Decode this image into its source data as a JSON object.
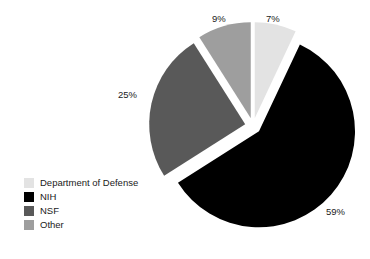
{
  "chart_data": {
    "type": "pie",
    "title": "",
    "subtitle": "",
    "xlabel": "",
    "ylabel": "",
    "grid": false,
    "legend_position": "bottom-left",
    "exploded": true,
    "start_angle_deg": 0,
    "direction": "clockwise",
    "categories": [
      "Department of Defense",
      "NIH",
      "NSF",
      "Other"
    ],
    "values": [
      7,
      59,
      25,
      9
    ],
    "value_unit": "%",
    "colors": [
      "#e3e3e3",
      "#000000",
      "#595959",
      "#9e9e9e"
    ],
    "slices": [
      {
        "label": "Department of Defense",
        "value": 7,
        "display": "7%",
        "color": "#e3e3e3",
        "start_deg": 0,
        "end_deg": 25.2,
        "explode": 0.08
      },
      {
        "label": "NIH",
        "value": 59,
        "display": "59%",
        "color": "#000000",
        "start_deg": 25.2,
        "end_deg": 237.6,
        "explode": 0.08
      },
      {
        "label": "NSF",
        "value": 25,
        "display": "25%",
        "color": "#595959",
        "start_deg": 237.6,
        "end_deg": 327.6,
        "explode": 0.08
      },
      {
        "label": "Other",
        "value": 9,
        "display": "9%",
        "color": "#9e9e9e",
        "start_deg": 327.6,
        "end_deg": 360,
        "explode": 0.08
      }
    ],
    "data_labels": [
      {
        "text": "9%",
        "x": 212,
        "y": 22
      },
      {
        "text": "7%",
        "x": 266,
        "y": 22
      },
      {
        "text": "25%",
        "x": 118,
        "y": 98
      },
      {
        "text": "59%",
        "x": 326,
        "y": 215
      }
    ],
    "geometry": {
      "center_x": 253,
      "center_y": 126,
      "radius": 96,
      "explode_distance": 8
    }
  },
  "legend": {
    "items": [
      {
        "label": "Department of Defense",
        "color": "#e3e3e3"
      },
      {
        "label": "NIH",
        "color": "#000000"
      },
      {
        "label": "NSF",
        "color": "#595959"
      },
      {
        "label": "Other",
        "color": "#9e9e9e"
      }
    ]
  }
}
